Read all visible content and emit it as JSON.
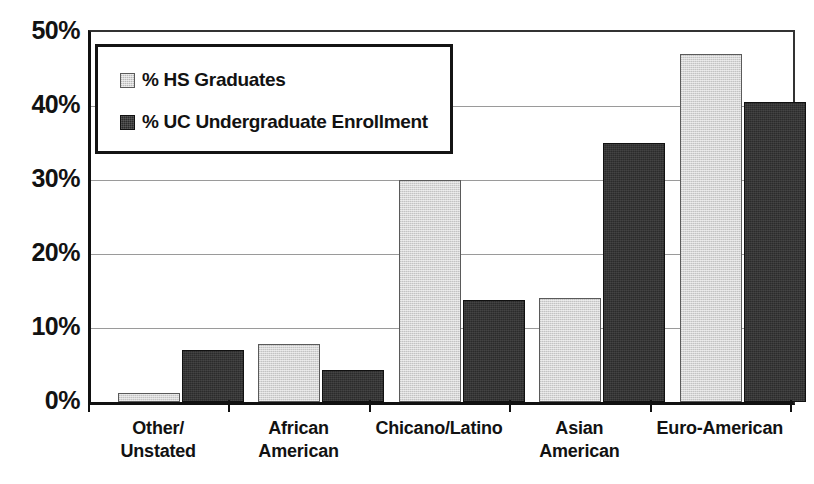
{
  "chart_data": {
    "type": "bar",
    "title": "",
    "xlabel": "",
    "ylabel": "",
    "ylim": [
      0,
      50
    ],
    "y_unit": "%",
    "grid": true,
    "legend_position": "upper-left-inside",
    "categories": [
      "Other/\nUnstated",
      "African\nAmerican",
      "Chicano/Latino",
      "Asian\nAmerican",
      "Euro-American"
    ],
    "category_lines": [
      [
        "Other/",
        "Unstated"
      ],
      [
        "African",
        "American"
      ],
      [
        "Chicano/Latino"
      ],
      [
        "Asian",
        "American"
      ],
      [
        "Euro-American"
      ]
    ],
    "ytick_labels": [
      "50%",
      "40%",
      "30%",
      "20%",
      "10%",
      "0%"
    ],
    "ytick_values": [
      50,
      40,
      30,
      20,
      10,
      0
    ],
    "series": [
      {
        "name": "% HS Graduates",
        "key": "hs",
        "color": "#d6d6d6",
        "values": [
          1.2,
          7.8,
          30.0,
          14.0,
          47.0
        ]
      },
      {
        "name": "% UC Undergraduate Enrollment",
        "key": "uc",
        "color": "#2b2b2b",
        "values": [
          7.0,
          4.3,
          13.8,
          35.0,
          40.5
        ]
      }
    ]
  },
  "legend": {
    "items": [
      {
        "label": "% HS Graduates",
        "swatch": "legend-swatch-hs"
      },
      {
        "label": "% UC Undergraduate Enrollment",
        "swatch": "legend-swatch-uc"
      }
    ]
  }
}
